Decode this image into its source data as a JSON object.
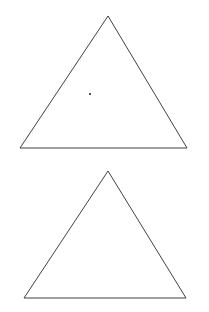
{
  "diagrams": [
    {
      "id": "top",
      "type": "ternary-phase-diagram",
      "vertices": {
        "A": {
          "label": "A",
          "x": 20,
          "y": 148
        },
        "B": {
          "label": "B",
          "x": 187,
          "y": 148
        },
        "C": {
          "label": "C",
          "x": 108,
          "y": 16
        }
      },
      "region_labels": {
        "P": "P",
        "Q": "Q",
        "R": "R",
        "S": "S",
        "T": "T"
      },
      "binodal_curve": "M34,148 C40,138 44,132 48,130 C60,112 75,97 90,94 C104,90 118,96 130,104 C140,111 146,118 150,124 C160,134 168,142 175,148",
      "tie_lines": [
        {
          "x1": 59,
          "y1": 118,
          "x2": 123,
          "y2": 103
        },
        {
          "x1": 48,
          "y1": 131,
          "x2": 142,
          "y2": 117
        },
        {
          "x1": 38,
          "y1": 141,
          "x2": 158,
          "y2": 133
        }
      ],
      "plait_point": {
        "x": 90,
        "y": 94
      }
    },
    {
      "id": "bottom",
      "type": "ternary-phase-diagram",
      "vertices": {
        "A": {
          "label": "A",
          "x": 24,
          "y": 298
        },
        "B": {
          "label": "B",
          "x": 186,
          "y": 298
        },
        "C": {
          "label": "C",
          "x": 108,
          "y": 171
        }
      },
      "region_labels": {
        "P": "P",
        "R": "R",
        "S": "S"
      },
      "left_curve": "M67,298 L81,273 L97,247 L111,228 L128,206",
      "right_curve": "M138,298 C140,290 141,287 143,283 C145,278 147,276 149,274 C152,270 155,266 162,259",
      "tie_lines": [
        {
          "x1": 111,
          "y1": 228,
          "x2": 153,
          "y2": 266
        },
        {
          "x1": 97,
          "y1": 247,
          "x2": 148,
          "y2": 275
        },
        {
          "x1": 81,
          "y1": 273,
          "x2": 140,
          "y2": 286
        }
      ]
    }
  ]
}
